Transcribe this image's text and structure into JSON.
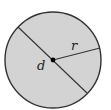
{
  "diagram": {
    "labels": {
      "diameter": "d",
      "radius": "r"
    },
    "colors": {
      "fill": "#d3d3d3",
      "stroke": "#333333",
      "center_dot": "#000000"
    }
  }
}
